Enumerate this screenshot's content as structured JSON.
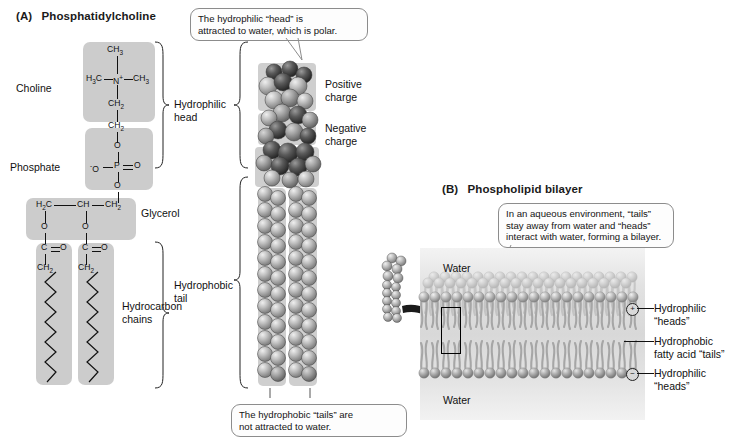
{
  "figure": {
    "panels": [
      {
        "id": "A",
        "tag": "(A)",
        "title": "Phosphatidylcholine"
      },
      {
        "id": "B",
        "tag": "(B)",
        "title": "Phospholipid bilayer"
      }
    ]
  },
  "panel_a": {
    "tag": "(A)",
    "title": "Phosphatidylcholine",
    "structure_labels": [
      {
        "key": "choline",
        "text": "Choline"
      },
      {
        "key": "phosphate",
        "text": "Phosphate"
      },
      {
        "key": "glycerol",
        "text": "Glycerol"
      },
      {
        "key": "hydrocarbon",
        "text": "Hydrocarbon\nchains"
      }
    ],
    "hydrocarbon_label_line1": "Hydrocarbon",
    "hydrocarbon_label_line2": "chains",
    "brackets": [
      {
        "key": "hydrophilic-head",
        "line1": "Hydrophilic",
        "line2": "head"
      },
      {
        "key": "hydrophobic-tail",
        "line1": "Hydrophobic",
        "line2": "tail"
      }
    ],
    "chem": {
      "choline": {
        "top_methyl": "CH3",
        "left_methyl": "H3C",
        "center": "N+",
        "right_methyl": "CH3",
        "ch2_a": "CH2",
        "ch2_b": "CH2"
      },
      "phosphate": {
        "o_top": "O",
        "o_left": "-O",
        "p": "P",
        "o_right": "O",
        "o_bottom": "O"
      },
      "glycerol": {
        "h2c": "H2C",
        "ch": "CH",
        "ch2": "CH2",
        "o_left": "O",
        "o_mid": "O",
        "ester_left_c": "C",
        "ester_left_o": "O",
        "ester_right_c": "C",
        "ester_right_o": "O",
        "ch2_left": "CH2",
        "ch2_right": "CH2"
      }
    },
    "model_labels": [
      {
        "key": "positive-charge",
        "line1": "Positive",
        "line2": "charge"
      },
      {
        "key": "negative-charge",
        "line1": "Negative",
        "line2": "charge"
      }
    ],
    "callouts": [
      {
        "key": "head-callout",
        "line1": "The hydrophilic “head” is",
        "line2": "attracted to water, which is polar."
      },
      {
        "key": "tail-callout",
        "line1": "The hydrophobic “tails” are",
        "line2": "not attracted to water."
      }
    ]
  },
  "panel_b": {
    "tag": "(B)",
    "title": "Phospholipid bilayer",
    "callout": {
      "key": "bilayer-callout",
      "line1": "In an aqueous environment, “tails”",
      "line2": "stay away from water and “heads”",
      "line3": "interact with water, forming a bilayer."
    },
    "water_top": "Water",
    "water_bottom": "Water",
    "side_labels": [
      {
        "key": "hydrophilic-heads-top",
        "line1": "Hydrophilic",
        "line2": "“heads”"
      },
      {
        "key": "hydrophobic-tails",
        "line1": "Hydrophobic",
        "line2": "fatty acid “tails”"
      },
      {
        "key": "hydrophilic-heads-bottom",
        "line1": "Hydrophilic",
        "line2": "“heads”"
      }
    ],
    "charge_markers": [
      {
        "key": "plus",
        "text": "+"
      },
      {
        "key": "minus",
        "text": "−"
      }
    ]
  },
  "colors": {
    "group_box": "#cccccc",
    "callout_border": "#8c8c8c",
    "sphere_light": "#b9b9b9",
    "sphere_dark": "#4a4a4a",
    "bilayer_bg": "#dcdcdc",
    "text": "#111111"
  }
}
